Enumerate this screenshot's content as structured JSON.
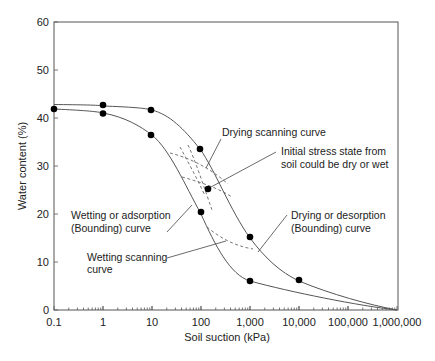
{
  "chart_data": {
    "type": "line",
    "title": "",
    "xlabel": "Soil suction (kPa)",
    "ylabel": "Water content (%)",
    "xscale": "log",
    "xlim": [
      0.1,
      1000000
    ],
    "ylim": [
      0,
      60
    ],
    "x_ticks": [
      0.1,
      1,
      10,
      100,
      1000,
      10000,
      100000,
      1000000
    ],
    "x_tick_labels": [
      "0.1",
      "1",
      "10",
      "100",
      "1,000",
      "10,000",
      "100,000",
      "1,000,000"
    ],
    "y_ticks": [
      0,
      10,
      20,
      30,
      40,
      50,
      60
    ],
    "y_tick_labels": [
      "0",
      "10",
      "20",
      "30",
      "40",
      "50",
      "60"
    ],
    "grid": false,
    "legend": null,
    "series": [
      {
        "name": "Drying or desorption (Bounding) curve",
        "style": "solid",
        "x": [
          0.1,
          1,
          10,
          100,
          1000,
          10000,
          1000000
        ],
        "y": [
          42.8,
          42.5,
          41.5,
          33.5,
          15,
          6,
          0
        ],
        "markers": [
          [
            1,
            42.5
          ],
          [
            10,
            41.5
          ],
          [
            100,
            33.5
          ],
          [
            1000,
            15
          ],
          [
            10000,
            6
          ]
        ]
      },
      {
        "name": "Wetting or adsorption (Bounding) curve",
        "style": "solid",
        "x": [
          0.1,
          1,
          10,
          100,
          1000,
          1000000
        ],
        "y": [
          41.8,
          40.8,
          36.3,
          20,
          6,
          0
        ],
        "markers": [
          [
            0.1,
            41.8
          ],
          [
            1,
            40.8
          ],
          [
            10,
            36.3
          ],
          [
            100,
            20
          ],
          [
            1000,
            6
          ]
        ]
      },
      {
        "name": "Drying scanning curve",
        "style": "dashed",
        "x": [
          30,
          60,
          150,
          400
        ],
        "y": [
          32,
          29.5,
          26.5,
          23
        ]
      },
      {
        "name": "Wetting scanning curve",
        "style": "dashed",
        "x": [
          120,
          250,
          600,
          1000
        ],
        "y": [
          17.5,
          15.5,
          14,
          13.5
        ]
      }
    ],
    "points": [
      {
        "label": "Initial stress state",
        "x": 150,
        "y": 25
      }
    ],
    "annotations": [
      "Drying scanning curve",
      "Initial stress state from soil could be dry or wet",
      "Wetting or adsorption (Bounding) curve",
      "Drying or desorption (Bounding) curve",
      "Wetting scanning curve"
    ]
  },
  "axes": {
    "xlabel": "Soil suction (kPa)",
    "ylabel": "Water content (%)",
    "x_ticks": [
      "0.1",
      "1",
      "10",
      "100",
      "1,000",
      "10,000",
      "100,000",
      "1,000,000"
    ],
    "y_ticks": [
      "0",
      "10",
      "20",
      "30",
      "40",
      "50",
      "60"
    ]
  },
  "labels": {
    "drying_scanning": "Drying scanning curve",
    "initial_stress_1": "Initial stress state from",
    "initial_stress_2": "soil could be dry or wet",
    "wetting_bounding_1": "Wetting or adsorption",
    "wetting_bounding_2": "(Bounding) curve",
    "drying_bounding_1": "Drying or desorption",
    "drying_bounding_2": "(Bounding) curve",
    "wetting_scanning_1": "Wetting scanning",
    "wetting_scanning_2": "curve"
  }
}
